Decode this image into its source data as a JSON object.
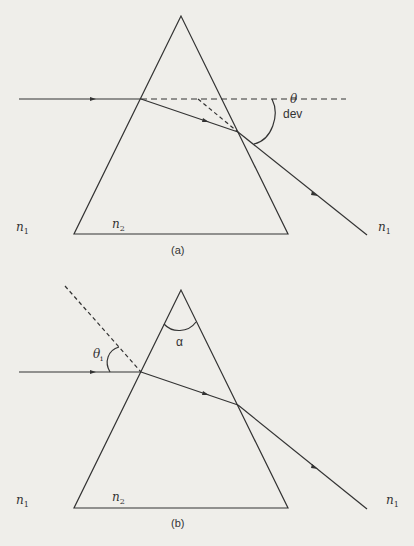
{
  "figure_a": {
    "caption": "(a)",
    "labels": {
      "n1_left": "n",
      "n1_left_sub": "1",
      "n2": "n",
      "n2_sub": "2",
      "n1_right": "n",
      "n1_right_sub": "1",
      "theta": "θ",
      "dev": "dev"
    }
  },
  "figure_b": {
    "caption": "(b)",
    "labels": {
      "n1_left": "n",
      "n1_left_sub": "1",
      "n2": "n",
      "n2_sub": "2",
      "n1_right": "n",
      "n1_right_sub": "1",
      "theta": "θ",
      "theta_sub": "i",
      "alpha": "α"
    }
  },
  "colors": {
    "line": "#333333",
    "background": "#efeeea"
  }
}
